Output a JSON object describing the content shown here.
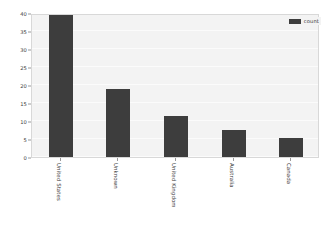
{
  "chart_data": {
    "type": "bar",
    "title": "",
    "xlabel": "",
    "ylabel": "",
    "categories": [
      "United States",
      "Unknown",
      "United Kingdom",
      "Australia",
      "Canada"
    ],
    "values": [
      40,
      19,
      11.5,
      7.4,
      5.4
    ],
    "series": [
      {
        "name": "count",
        "values": [
          40,
          19,
          11.5,
          7.4,
          5.4
        ]
      }
    ],
    "ylim": [
      0,
      40
    ],
    "yticks": [
      0,
      5,
      10,
      15,
      20,
      25,
      30,
      35,
      40
    ],
    "ytick_labels": [
      "0",
      "5",
      "10",
      "15",
      "20",
      "25",
      "30",
      "35",
      "40"
    ],
    "grid": true,
    "legend_position": "upper right",
    "legend_entries": [
      "count"
    ],
    "bar_color": "#3d3d3d",
    "plot_background": "#f3f3f3",
    "figure_background": "#ffffff",
    "grid_color": "#fbfbfb",
    "xtick_rotation": 90
  },
  "legend": {
    "label": "count"
  }
}
